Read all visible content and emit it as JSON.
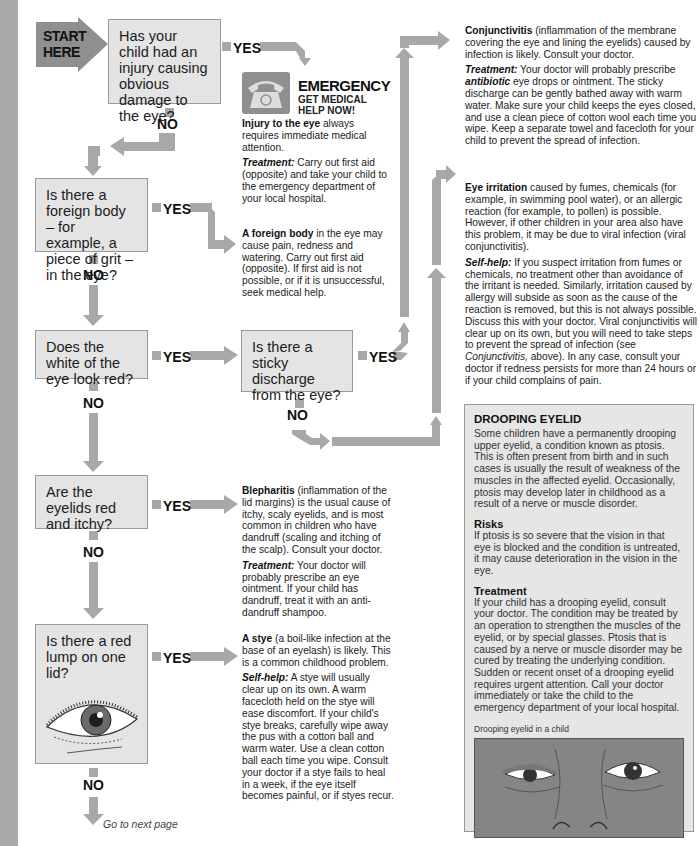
{
  "start": {
    "label_line1": "START",
    "label_line2": "HERE"
  },
  "questions": [
    {
      "id": "q1",
      "text": "Has your child had an injury causing obvious damage to the eye?"
    },
    {
      "id": "q2",
      "text": "Is there a foreign body – for example, a piece of grit – in the eye?"
    },
    {
      "id": "q3",
      "text": "Does the white of the eye look red?"
    },
    {
      "id": "q3b",
      "text": "Is there a sticky discharge from the eye?"
    },
    {
      "id": "q4",
      "text": "Are the eyelids red and itchy?"
    },
    {
      "id": "q5",
      "text": "Is there a red lump on one lid?"
    }
  ],
  "labels": {
    "yes": "YES",
    "no": "NO",
    "go_next": "Go to next page"
  },
  "emergency": {
    "title": "EMERGENCY",
    "subtitle1": "GET MEDICAL",
    "subtitle2": "HELP NOW!",
    "lead": "Injury to the eye",
    "lead_rest": " always requires immediate medical attention.",
    "t_label": "Treatment:",
    "t_text": " Carry out first aid (opposite) and take your child to the emergency department of your local hospital."
  },
  "foreign_body": {
    "lead": "A foreign body",
    "rest": " in the eye may cause pain, redness and watering. Carry out first aid (opposite). If first aid is not possible, or if it is unsuccessful, seek medical help."
  },
  "conjunctivitis": {
    "lead": "Conjunctivitis",
    "rest": " (inflammation of the membrane covering the eye and lining the eyelids) caused by infection is likely. Consult your doctor.",
    "t_label": "Treatment:",
    "t_pre": " Your doctor will probably prescribe ",
    "t_em": "antibiotic",
    "t_post": " eye drops or ointment. The sticky discharge can be gently bathed away with warm water. Make sure your child keeps the eyes closed, and use a clean piece of cotton wool each time you wipe. Keep a separate towel and facecloth for your child to prevent the spread of infection."
  },
  "irritation": {
    "lead": "Eye irritation",
    "rest": " caused by fumes, chemicals (for example, in swimming pool water), or an allergic reaction (for example, to pollen) is possible. However, if other children in your area also have this problem, it may be due to viral infection (viral conjunctivitis).",
    "s_label": "Self-help:",
    "s_pre": " If you suspect irritation from fumes or chemicals, no treatment other than avoidance of the irritant is needed. Similarly, irritation caused by allergy will subside as soon as the cause of the reaction is removed, but this is not always possible. Discuss this with your doctor. Viral conjunctivitis will clear up on its own, but you will need to take steps to prevent the spread of infection (see ",
    "s_em": "Conjunctivitis,",
    "s_post": " above). In any case, consult your doctor if redness persists for more than 24 hours or if your child complains of pain."
  },
  "blepharitis": {
    "lead": "Blepharitis",
    "rest": " (inflammation of the lid margins) is the usual cause of itchy, scaly eyelids, and is most common in children who have dandruff (scaling and itching of the scalp). Consult your doctor.",
    "t_label": "Treatment:",
    "t_text": " Your doctor will probably prescribe an eye ointment. If your child has dandruff, treat it with an anti-dandruff shampoo."
  },
  "stye": {
    "lead": "A stye",
    "rest": " (a boil-like infection at the base of an eyelash) is likely. This is a common childhood problem.",
    "s_label": "Self-help:",
    "s_text": " A stye will usually clear up on its own. A warm facecloth held on the stye will ease discomfort. If your child's stye breaks, carefully wipe away the pus with a cotton ball and warm water. Use a clean cotton ball each time you wipe. Consult your doctor if a stye fails to heal in a week, if the eye itself becomes painful, or if styes recur."
  },
  "drooping": {
    "title": "DROOPING EYELID",
    "intro": "Some children have a permanently drooping upper eyelid, a condition known as ptosis. This is often present from birth and in such cases is usually the result of weakness of the muscles in the affected eyelid. Occasionally, ptosis may develop later in childhood as a result of a nerve or muscle disorder.",
    "risks_title": "Risks",
    "risks": "If ptosis is so severe that the vision in that eye is blocked and the condition is untreated, it may cause deterioration in the vision in the eye.",
    "treat_title": "Treatment",
    "treat": "If your child has a drooping eyelid, consult your doctor. The condition may be treated by an operation to strengthen the muscles of the eyelid, or by special glasses. Ptosis that is caused by a nerve or muscle disorder may be cured by treating the underlying condition. Sudden or recent onset of a drooping eyelid requires urgent attention. Call your doctor immediately or take the child to the emergency department of your local hospital.",
    "caption": "Drooping eyelid in a child"
  },
  "colors": {
    "box_fill": "#e4e4e4",
    "connector": "#a8a8a8",
    "start_arrow": "#8f8f8f",
    "edge": "#a9a9a9"
  }
}
